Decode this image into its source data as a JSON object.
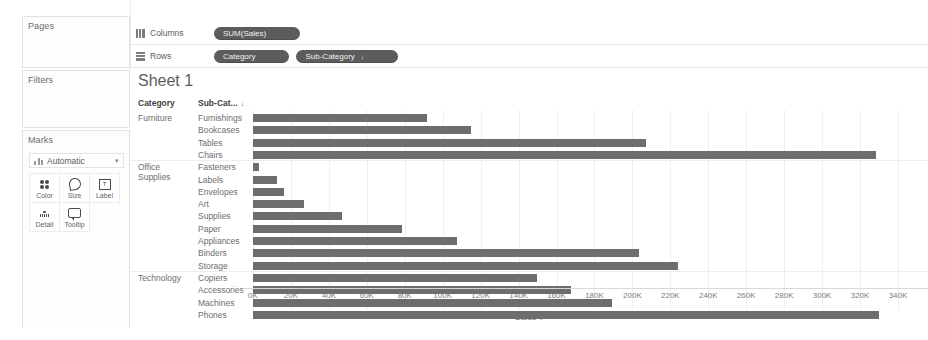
{
  "sidebar": {
    "pages": {
      "title": "Pages"
    },
    "filters": {
      "title": "Filters"
    },
    "marks": {
      "title": "Marks",
      "type_label": "Automatic",
      "type_icon": "bar-mark-icon",
      "caret": "▾",
      "buttons": [
        {
          "label": "Color",
          "icon": "color-icon"
        },
        {
          "label": "Size",
          "icon": "size-icon"
        },
        {
          "label": "Label",
          "icon": "label-icon"
        },
        {
          "label": "Detail",
          "icon": "detail-icon"
        },
        {
          "label": "Tooltip",
          "icon": "tooltip-icon"
        }
      ]
    }
  },
  "shelves": {
    "columns": {
      "label": "Columns",
      "icon": "columns-icon",
      "pills": [
        {
          "text": "SUM(Sales)"
        }
      ]
    },
    "rows": {
      "label": "Rows",
      "icon": "rows-icon",
      "pills": [
        {
          "text": "Category"
        },
        {
          "text": "Sub-Category",
          "sort": "↓"
        }
      ]
    }
  },
  "worksheet": {
    "title": "Sheet 1",
    "headers": {
      "category": "Category",
      "subcategory": "Sub-Cat...",
      "sort_glyph": "↓"
    },
    "axis_title": "Sales",
    "axis_sort_glyph": "↓",
    "bar_color": "#6d6d6d"
  },
  "chart_data": {
    "type": "bar",
    "title": "Sheet 1",
    "orientation": "horizontal",
    "xlabel": "Sales",
    "ylabel": "",
    "xlim": [
      0,
      340000
    ],
    "grid": true,
    "legend": null,
    "tick_labels": [
      "0K",
      "20K",
      "40K",
      "60K",
      "80K",
      "100K",
      "120K",
      "140K",
      "160K",
      "180K",
      "200K",
      "220K",
      "240K",
      "260K",
      "280K",
      "300K",
      "320K",
      "340K"
    ],
    "tick_values": [
      0,
      20000,
      40000,
      60000,
      80000,
      100000,
      120000,
      140000,
      160000,
      180000,
      200000,
      220000,
      240000,
      260000,
      280000,
      300000,
      320000,
      340000
    ],
    "groups": [
      {
        "category": "Furniture",
        "items": [
          {
            "subcategory": "Furnishings",
            "value": 91705
          },
          {
            "subcategory": "Bookcases",
            "value": 114880
          },
          {
            "subcategory": "Tables",
            "value": 206966
          },
          {
            "subcategory": "Chairs",
            "value": 328449
          }
        ]
      },
      {
        "category": "Office Supplies",
        "items": [
          {
            "subcategory": "Fasteners",
            "value": 3024
          },
          {
            "subcategory": "Labels",
            "value": 12486
          },
          {
            "subcategory": "Envelopes",
            "value": 16476
          },
          {
            "subcategory": "Art",
            "value": 27119
          },
          {
            "subcategory": "Supplies",
            "value": 46674
          },
          {
            "subcategory": "Paper",
            "value": 78479
          },
          {
            "subcategory": "Appliances",
            "value": 107532
          },
          {
            "subcategory": "Binders",
            "value": 203413
          },
          {
            "subcategory": "Storage",
            "value": 223844
          }
        ]
      },
      {
        "category": "Technology",
        "items": [
          {
            "subcategory": "Copiers",
            "value": 149528
          },
          {
            "subcategory": "Accessories",
            "value": 167380
          },
          {
            "subcategory": "Machines",
            "value": 189239
          },
          {
            "subcategory": "Phones",
            "value": 330007
          }
        ]
      }
    ]
  }
}
